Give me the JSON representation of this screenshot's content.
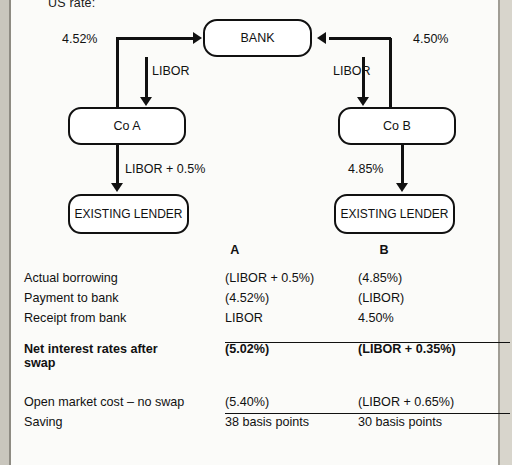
{
  "page": {
    "cropped_top_text": "US rate:"
  },
  "diagram": {
    "nodes": [
      {
        "id": "bank",
        "label": "BANK"
      },
      {
        "id": "co_a",
        "label": "Co A"
      },
      {
        "id": "co_b",
        "label": "Co B"
      },
      {
        "id": "lender_a",
        "label": "EXISTING LENDER"
      },
      {
        "id": "lender_b",
        "label": "EXISTING LENDER"
      }
    ],
    "labels": {
      "left_rate": "4.52%",
      "right_rate": "4.50%",
      "left_libor": "LIBOR",
      "right_libor": "LIBOR",
      "left_existing": "LIBOR + 0.5%",
      "right_existing": "4.85%"
    }
  },
  "table": {
    "headers": {
      "label": "",
      "a": "A",
      "b": "B"
    },
    "rows": [
      {
        "label": "Actual borrowing",
        "a": "(LIBOR + 0.5%)",
        "b": "(4.85%)",
        "bold": false
      },
      {
        "label": "Payment to bank",
        "a": "(4.52%)",
        "b": "(LIBOR)",
        "bold": false
      },
      {
        "label": "Receipt from bank",
        "a": "LIBOR",
        "b": "4.50%",
        "bold": false
      }
    ],
    "net_row": {
      "label_line1": "Net interest rates after",
      "label_line2": "swap",
      "a": "(5.02%)",
      "b": "(LIBOR + 0.35%)"
    },
    "bottom_rows": [
      {
        "label": "Open market cost – no swap",
        "a": "(5.40%)",
        "b": "(LIBOR + 0.65%)"
      },
      {
        "label": "Saving",
        "a": "38 basis points",
        "b": "30 basis points"
      }
    ]
  },
  "colors": {
    "ink": "#111111",
    "page": "#fbfbf9",
    "edge": "#c9c6bd"
  }
}
